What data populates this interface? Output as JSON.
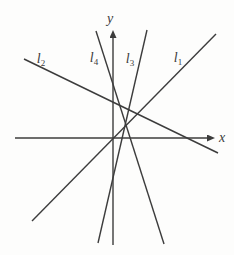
{
  "figure": {
    "background": "#fdfdfc",
    "ink_color": "#3c3c3c",
    "axes": {
      "x_label": "x",
      "y_label": "y",
      "x_axis": {
        "x1": 15,
        "y1": 138,
        "x2": 208,
        "y2": 138
      },
      "y_axis": {
        "x1": 113,
        "y1": 245,
        "x2": 113,
        "y2": 37
      },
      "x_label_pos": {
        "x": 219,
        "y": 142
      },
      "y_label_pos": {
        "x": 110,
        "y": 23
      }
    },
    "lines": [
      {
        "name": "l1",
        "label_base": "l",
        "label_sub": "1",
        "slope_sign": "positive",
        "geometry": {
          "x1": 32,
          "y1": 221,
          "x2": 216,
          "y2": 34
        },
        "label_pos": {
          "x": 178,
          "y": 62
        }
      },
      {
        "name": "l2",
        "label_base": "l",
        "label_sub": "2",
        "slope_sign": "negative",
        "geometry": {
          "x1": 24,
          "y1": 59,
          "x2": 218,
          "y2": 153
        },
        "label_pos": {
          "x": 41,
          "y": 63
        }
      },
      {
        "name": "l3",
        "label_base": "l",
        "label_sub": "3",
        "slope_sign": "positive-steep",
        "geometry": {
          "x1": 98,
          "y1": 243,
          "x2": 147,
          "y2": 30
        },
        "label_pos": {
          "x": 130,
          "y": 63
        }
      },
      {
        "name": "l4",
        "label_base": "l",
        "label_sub": "4",
        "slope_sign": "negative-steep",
        "geometry": {
          "x1": 96,
          "y1": 31,
          "x2": 164,
          "y2": 244
        },
        "label_pos": {
          "x": 94,
          "y": 62
        }
      }
    ]
  }
}
